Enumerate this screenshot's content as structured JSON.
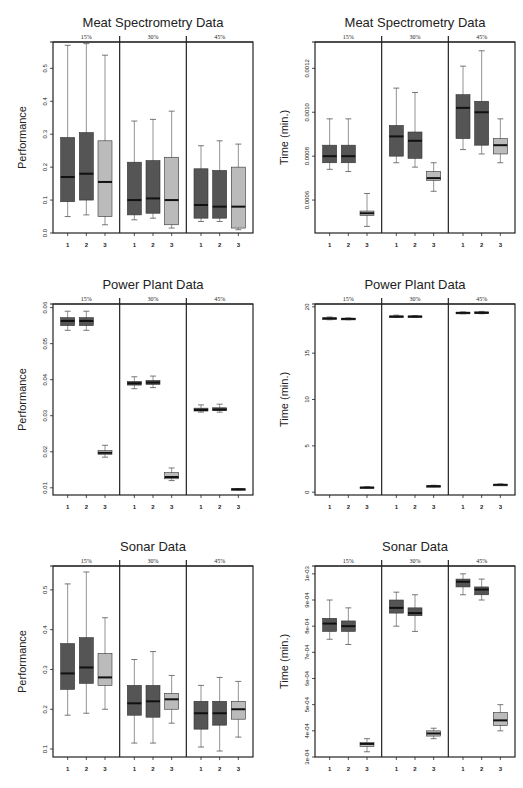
{
  "figure": {
    "groups": [
      "15%",
      "30%",
      "45%"
    ],
    "methods": [
      "1",
      "2",
      "3"
    ],
    "colors": {
      "method1": "#555555",
      "method2": "#555555",
      "method3": "#bbbbbb",
      "median": "#111111",
      "axis": "#222222"
    }
  },
  "chart_data": [
    {
      "type": "boxplot",
      "title": "Meat Spectrometry Data",
      "ylabel": "Performance",
      "xlabel": "",
      "ylim": [
        0.0,
        0.58
      ],
      "yticks": [
        0.0,
        0.1,
        0.2,
        0.3,
        0.4,
        0.5
      ],
      "ytick_labels": [
        "0.0",
        "0.1",
        "0.2",
        "0.3",
        "0.4",
        "0.5"
      ],
      "groups": [
        "15%",
        "30%",
        "45%"
      ],
      "categories": [
        "1",
        "2",
        "3"
      ],
      "boxes": [
        [
          [
            0.05,
            0.095,
            0.17,
            0.29,
            0.57
          ],
          [
            0.055,
            0.1,
            0.18,
            0.305,
            0.575
          ],
          [
            0.025,
            0.05,
            0.155,
            0.28,
            0.54
          ]
        ],
        [
          [
            0.04,
            0.055,
            0.1,
            0.215,
            0.34
          ],
          [
            0.045,
            0.06,
            0.105,
            0.22,
            0.345
          ],
          [
            0.015,
            0.025,
            0.1,
            0.23,
            0.37
          ]
        ],
        [
          [
            0.035,
            0.045,
            0.085,
            0.195,
            0.265
          ],
          [
            0.035,
            0.045,
            0.08,
            0.19,
            0.28
          ],
          [
            0.01,
            0.015,
            0.08,
            0.2,
            0.27
          ]
        ]
      ]
    },
    {
      "type": "boxplot",
      "title": "Meat Spectrometry Data",
      "ylabel": "Time (min.)",
      "xlabel": "",
      "ylim": [
        0.00045,
        0.00132
      ],
      "yticks": [
        0.0006,
        0.0008,
        0.001,
        0.0012
      ],
      "ytick_labels": [
        "0.0006",
        "0.0008",
        "0.0010",
        "0.0012"
      ],
      "groups": [
        "15%",
        "30%",
        "45%"
      ],
      "categories": [
        "1",
        "2",
        "3"
      ],
      "boxes": [
        [
          [
            0.00074,
            0.00077,
            0.0008,
            0.00085,
            0.00097
          ],
          [
            0.00073,
            0.00077,
            0.0008,
            0.00085,
            0.00097
          ],
          [
            0.00048,
            0.00053,
            0.00054,
            0.00055,
            0.00063
          ]
        ],
        [
          [
            0.00077,
            0.0008,
            0.00089,
            0.00094,
            0.00111
          ],
          [
            0.00075,
            0.00079,
            0.00087,
            0.00091,
            0.00109
          ],
          [
            0.00064,
            0.00069,
            0.0007,
            0.00073,
            0.00077
          ]
        ],
        [
          [
            0.00083,
            0.00088,
            0.00102,
            0.00108,
            0.00121
          ],
          [
            0.00081,
            0.00085,
            0.001,
            0.00105,
            0.00128
          ],
          [
            0.00077,
            0.00081,
            0.00085,
            0.00088,
            0.00097
          ]
        ]
      ]
    },
    {
      "type": "boxplot",
      "title": "Power Plant Data",
      "ylabel": "Performance",
      "xlabel": "",
      "ylim": [
        0.008,
        0.061
      ],
      "yticks": [
        0.01,
        0.02,
        0.03,
        0.04,
        0.05,
        0.06
      ],
      "ytick_labels": [
        "0.01",
        "0.02",
        "0.03",
        "0.04",
        "0.05",
        "0.06"
      ],
      "groups": [
        "15%",
        "30%",
        "45%"
      ],
      "categories": [
        "1",
        "2",
        "3"
      ],
      "boxes": [
        [
          [
            0.0537,
            0.055,
            0.0563,
            0.0572,
            0.059
          ],
          [
            0.0537,
            0.055,
            0.0563,
            0.0572,
            0.059
          ],
          [
            0.0185,
            0.0193,
            0.0197,
            0.0203,
            0.0218
          ]
        ],
        [
          [
            0.0375,
            0.0385,
            0.039,
            0.0395,
            0.0408
          ],
          [
            0.0378,
            0.0387,
            0.0392,
            0.0398,
            0.041
          ],
          [
            0.012,
            0.0125,
            0.013,
            0.0142,
            0.0155
          ]
        ],
        [
          [
            0.031,
            0.0313,
            0.0316,
            0.0321,
            0.033
          ],
          [
            0.031,
            0.0314,
            0.0317,
            0.0322,
            0.0332
          ],
          [
            0.0094,
            0.0095,
            0.0096,
            0.0097,
            0.0098
          ]
        ]
      ]
    },
    {
      "type": "boxplot",
      "title": "Power Plant Data",
      "ylabel": "Time (min.)",
      "xlabel": "",
      "ylim": [
        -0.3,
        20.3
      ],
      "yticks": [
        0,
        5,
        10,
        15,
        20
      ],
      "ytick_labels": [
        "0",
        "5",
        "10",
        "15",
        "20"
      ],
      "groups": [
        "15%",
        "30%",
        "45%"
      ],
      "categories": [
        "1",
        "2",
        "3"
      ],
      "boxes": [
        [
          [
            18.6,
            18.7,
            18.75,
            18.8,
            18.9
          ],
          [
            18.6,
            18.65,
            18.7,
            18.75,
            18.8
          ],
          [
            0.45,
            0.5,
            0.5,
            0.55,
            0.6
          ]
        ],
        [
          [
            18.85,
            18.9,
            18.95,
            19.0,
            19.1
          ],
          [
            18.85,
            18.9,
            18.95,
            19.0,
            19.05
          ],
          [
            0.6,
            0.65,
            0.65,
            0.7,
            0.75
          ]
        ],
        [
          [
            19.25,
            19.3,
            19.35,
            19.4,
            19.45
          ],
          [
            19.25,
            19.3,
            19.35,
            19.45,
            19.5
          ],
          [
            0.75,
            0.8,
            0.8,
            0.85,
            0.9
          ]
        ]
      ]
    },
    {
      "type": "boxplot",
      "title": "Sonar Data",
      "ylabel": "Performance",
      "xlabel": "",
      "ylim": [
        0.08,
        0.56
      ],
      "yticks": [
        0.1,
        0.2,
        0.3,
        0.4,
        0.5
      ],
      "ytick_labels": [
        "0.1",
        "0.2",
        "0.3",
        "0.4",
        "0.5"
      ],
      "groups": [
        "15%",
        "30%",
        "45%"
      ],
      "categories": [
        "1",
        "2",
        "3"
      ],
      "boxes": [
        [
          [
            0.185,
            0.25,
            0.29,
            0.365,
            0.515
          ],
          [
            0.19,
            0.265,
            0.305,
            0.38,
            0.545
          ],
          [
            0.2,
            0.26,
            0.28,
            0.34,
            0.43
          ]
        ],
        [
          [
            0.115,
            0.185,
            0.215,
            0.26,
            0.325
          ],
          [
            0.115,
            0.18,
            0.22,
            0.26,
            0.345
          ],
          [
            0.165,
            0.2,
            0.225,
            0.24,
            0.285
          ]
        ],
        [
          [
            0.105,
            0.15,
            0.19,
            0.22,
            0.26
          ],
          [
            0.095,
            0.16,
            0.19,
            0.22,
            0.28
          ],
          [
            0.13,
            0.175,
            0.2,
            0.22,
            0.27
          ]
        ]
      ]
    },
    {
      "type": "boxplot",
      "title": "Sonar Data",
      "ylabel": "Time (min.)",
      "xlabel": "",
      "ylim": [
        0.0003,
        0.00103
      ],
      "yticks": [
        0.0003,
        0.0004,
        0.0005,
        0.0006,
        0.0007,
        0.0008,
        0.0009,
        0.001
      ],
      "ytick_labels": [
        "3e-04",
        "4e-04",
        "5e-04",
        "6e-04",
        "7e-04",
        "8e-04",
        "9e-04",
        "1e-03"
      ],
      "groups": [
        "15%",
        "30%",
        "45%"
      ],
      "categories": [
        "1",
        "2",
        "3"
      ],
      "boxes": [
        [
          [
            0.00075,
            0.00078,
            0.00081,
            0.00083,
            0.0009
          ],
          [
            0.00073,
            0.00078,
            0.0008,
            0.00082,
            0.00087
          ],
          [
            0.00032,
            0.00034,
            0.00035,
            0.000355,
            0.00037
          ]
        ],
        [
          [
            0.0008,
            0.00085,
            0.00087,
            0.0009,
            0.00093
          ],
          [
            0.00078,
            0.00084,
            0.00085,
            0.00087,
            0.00092
          ],
          [
            0.00037,
            0.00038,
            0.00039,
            0.0004,
            0.00041
          ]
        ],
        [
          [
            0.00092,
            0.00095,
            0.00097,
            0.00098,
            0.001
          ],
          [
            0.0009,
            0.00092,
            0.00094,
            0.00095,
            0.00098
          ],
          [
            0.0004,
            0.00042,
            0.00044,
            0.00047,
            0.0005
          ]
        ]
      ]
    }
  ]
}
